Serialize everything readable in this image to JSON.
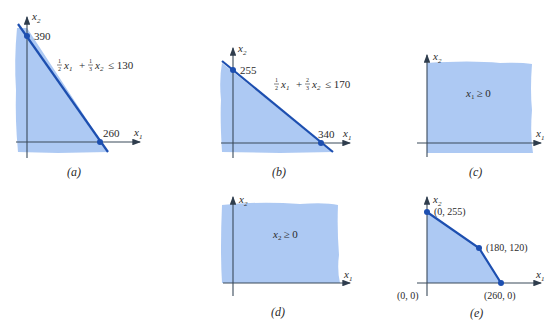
{
  "colors": {
    "shade": "#a9c6f2",
    "boundary": "#1d4fb0",
    "vertex": "#1d4fb0",
    "axis": "#3a4a5a",
    "text": "#2b2b2b"
  },
  "panels": [
    {
      "id": "a",
      "caption": "(a)",
      "x_axis_label": "x1",
      "y_axis_label": "x2",
      "constraint": "1/2 x1 + 1/3 x2 ≤ 130",
      "constraint_parts": {
        "c1": "1",
        "d1": "2",
        "c2": "1",
        "d2": "3",
        "rhs": "≤ 130"
      },
      "intercepts": [
        {
          "label": "390",
          "axis": "x2",
          "value": 390
        },
        {
          "label": "260",
          "axis": "x1",
          "value": 260
        }
      ]
    },
    {
      "id": "b",
      "caption": "(b)",
      "x_axis_label": "x1",
      "y_axis_label": "x2",
      "constraint": "1/2 x1 + 2/3 x2 ≤ 170",
      "constraint_parts": {
        "c1": "1",
        "d1": "2",
        "c2": "2",
        "d2": "3",
        "rhs": "≤ 170"
      },
      "intercepts": [
        {
          "label": "255",
          "axis": "x2",
          "value": 255
        },
        {
          "label": "340",
          "axis": "x1",
          "value": 340
        }
      ]
    },
    {
      "id": "c",
      "caption": "(c)",
      "x_axis_label": "x1",
      "y_axis_label": "x2",
      "constraint": "x1 ≥ 0",
      "constraint_text": "≥ 0"
    },
    {
      "id": "d",
      "caption": "(d)",
      "x_axis_label": "x1",
      "y_axis_label": "x2",
      "constraint": "x2 ≥ 0",
      "constraint_text": "≥ 0"
    },
    {
      "id": "e",
      "caption": "(e)",
      "x_axis_label": "x1",
      "y_axis_label": "x2",
      "vertices": [
        {
          "label": "(0, 0)",
          "x1": 0,
          "x2": 0
        },
        {
          "label": "(0, 255)",
          "x1": 0,
          "x2": 255
        },
        {
          "label": "(180, 120)",
          "x1": 180,
          "x2": 120
        },
        {
          "label": "(260, 0)",
          "x1": 260,
          "x2": 0
        }
      ]
    }
  ]
}
